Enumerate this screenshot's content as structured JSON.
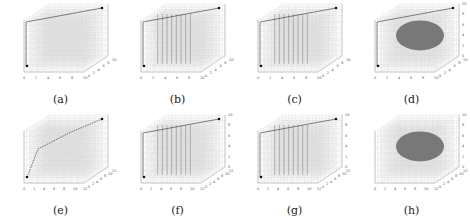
{
  "figure": {
    "panels": [
      {
        "id": "a",
        "caption": "(a)",
        "x_ticks": [
          "0",
          "2",
          "4",
          "6",
          "8",
          "10"
        ],
        "y_ticks": [
          "0",
          "2",
          "4",
          "6",
          "8",
          "10"
        ],
        "z_ticks": [],
        "path": "corner-to-corner edges",
        "density": "uniform",
        "cluster": false
      },
      {
        "id": "b",
        "caption": "(b)",
        "x_ticks": [
          "0",
          "2",
          "4",
          "6",
          "8",
          "10"
        ],
        "y_ticks": [
          "0",
          "2",
          "4",
          "6",
          "8",
          "10"
        ],
        "z_ticks": [],
        "path": "edges",
        "density": "vertical planes",
        "cluster": false
      },
      {
        "id": "c",
        "caption": "(c)",
        "x_ticks": [
          "0",
          "2",
          "4",
          "6",
          "8",
          "10"
        ],
        "y_ticks": [
          "0",
          "2",
          "4",
          "6",
          "8",
          "10"
        ],
        "z_ticks": [],
        "path": "edges",
        "density": "vertical planes",
        "cluster": false
      },
      {
        "id": "d",
        "caption": "(d)",
        "x_ticks": [
          "0",
          "2",
          "4",
          "6",
          "8",
          "10"
        ],
        "y_ticks": [
          "0",
          "2",
          "4",
          "6",
          "8",
          "10"
        ],
        "z_ticks": [
          "0",
          "2",
          "4",
          "6",
          "8",
          "10"
        ],
        "path": "diagonal",
        "density": "dense ellipsoid",
        "cluster": true
      },
      {
        "id": "e",
        "caption": "(e)",
        "x_ticks": [
          "0",
          "2",
          "4",
          "6",
          "8",
          "10",
          "12"
        ],
        "y_ticks": [
          "0",
          "2",
          "4",
          "6",
          "8",
          "10",
          "12"
        ],
        "z_ticks": [],
        "path": "dashed polyline",
        "density": "uniform",
        "cluster": false
      },
      {
        "id": "f",
        "caption": "(f)",
        "x_ticks": [
          "0",
          "2",
          "4",
          "6",
          "8",
          "10",
          "12"
        ],
        "y_ticks": [
          "0",
          "2",
          "4",
          "6",
          "8",
          "10",
          "12"
        ],
        "z_ticks": [
          "0",
          "2",
          "4",
          "6",
          "8",
          "10"
        ],
        "path": "polyline",
        "density": "vertical planes",
        "cluster": false
      },
      {
        "id": "g",
        "caption": "(g)",
        "x_ticks": [
          "0",
          "2",
          "4",
          "6",
          "8",
          "10",
          "12"
        ],
        "y_ticks": [
          "0",
          "2",
          "4",
          "6",
          "8",
          "10",
          "12"
        ],
        "z_ticks": [
          "0",
          "2",
          "4",
          "6",
          "8",
          "10"
        ],
        "path": "polyline",
        "density": "vertical planes",
        "cluster": false
      },
      {
        "id": "h",
        "caption": "(h)",
        "x_ticks": [
          "0",
          "2",
          "4",
          "6",
          "8",
          "10",
          "12"
        ],
        "y_ticks": [
          "0",
          "2",
          "4",
          "6",
          "8",
          "10",
          "12"
        ],
        "z_ticks": [
          "0",
          "2",
          "4",
          "6",
          "8",
          "10"
        ],
        "path": "none",
        "density": "dense ellipsoid",
        "cluster": true
      }
    ]
  },
  "chart_data": [
    {
      "type": "scatter",
      "title": "(a)",
      "xlabel": "",
      "ylabel": "",
      "xlim": [
        0,
        10
      ],
      "ylim": [
        0,
        10
      ],
      "grid": true
    },
    {
      "type": "scatter",
      "title": "(b)",
      "xlabel": "",
      "ylabel": "",
      "xlim": [
        0,
        10
      ],
      "ylim": [
        0,
        10
      ],
      "grid": true
    },
    {
      "type": "scatter",
      "title": "(c)",
      "xlabel": "",
      "ylabel": "",
      "xlim": [
        0,
        10
      ],
      "ylim": [
        0,
        10
      ],
      "grid": true
    },
    {
      "type": "scatter",
      "title": "(d)",
      "xlabel": "",
      "ylabel": "",
      "xlim": [
        0,
        10
      ],
      "ylim": [
        0,
        10
      ],
      "zlim": [
        0,
        10
      ],
      "grid": true
    },
    {
      "type": "scatter",
      "title": "(e)",
      "xlabel": "",
      "ylabel": "",
      "xlim": [
        0,
        12
      ],
      "ylim": [
        0,
        12
      ],
      "grid": true
    },
    {
      "type": "scatter",
      "title": "(f)",
      "xlabel": "",
      "ylabel": "",
      "xlim": [
        0,
        12
      ],
      "ylim": [
        0,
        12
      ],
      "zlim": [
        0,
        10
      ],
      "grid": true
    },
    {
      "type": "scatter",
      "title": "(g)",
      "xlabel": "",
      "ylabel": "",
      "xlim": [
        0,
        12
      ],
      "ylim": [
        0,
        12
      ],
      "zlim": [
        0,
        10
      ],
      "grid": true
    },
    {
      "type": "scatter",
      "title": "(h)",
      "xlabel": "",
      "ylabel": "",
      "xlim": [
        0,
        12
      ],
      "ylim": [
        0,
        12
      ],
      "zlim": [
        0,
        10
      ],
      "grid": true
    }
  ]
}
